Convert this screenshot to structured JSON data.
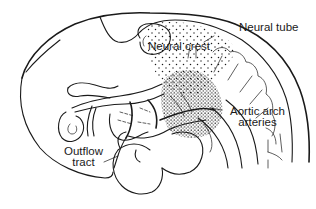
{
  "diagram": {
    "labels": {
      "neural_tube": "Neural tube",
      "neural_crest": "Neural crest",
      "aortic_arch_line1": "Aortic arch",
      "aortic_arch_line2": "arteries",
      "outflow_line1": "Outflow",
      "outflow_line2": "tract"
    },
    "colors": {
      "line": "#1a1a1a",
      "background": "#ffffff"
    }
  }
}
